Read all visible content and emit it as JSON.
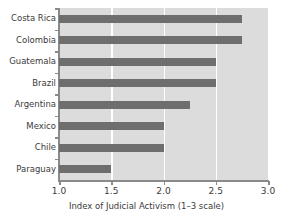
{
  "chart_data": {
    "type": "bar",
    "orientation": "horizontal",
    "title": "",
    "xlabel": "Index of Judicial Activism (1–3 scale)",
    "ylabel": "",
    "categories": [
      "Costa Rica",
      "Colombia",
      "Guatemala",
      "Brazil",
      "Argentina",
      "Mexico",
      "Chile",
      "Paraguay"
    ],
    "values": [
      2.75,
      2.75,
      2.5,
      2.5,
      2.25,
      2.0,
      2.0,
      1.5
    ],
    "xlim": [
      1.0,
      3.0
    ],
    "xticks": [
      "1.0",
      "1.5",
      "2.0",
      "2.5",
      "3.0"
    ],
    "xtick_values": [
      1.0,
      1.5,
      2.0,
      2.5,
      3.0
    ],
    "grid": "vertical-white",
    "legend": "none",
    "colors": {
      "bar": "#6e6e6e",
      "plot_background": "#dcdcdc",
      "gridline": "#ffffff",
      "axis": "#8a8a8a",
      "text": "#3b3b3b",
      "figure_background": "#ffffff"
    }
  }
}
